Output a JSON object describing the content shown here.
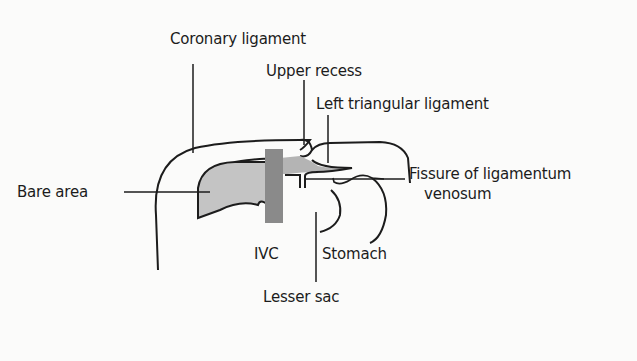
{
  "diagram": {
    "type": "anatomical-cross-section",
    "colors": {
      "background": "#fbfbfa",
      "stroke": "#1c1c1c",
      "bare_area_fill": "#c4c4c4",
      "ivc_fill": "#8a8a8a",
      "recess_fill": "#b4b4b4"
    },
    "labels": {
      "coronary_ligament": "Coronary ligament",
      "upper_recess": "Upper recess",
      "left_triangular_ligament": "Left triangular ligament",
      "bare_area": "Bare area",
      "fissure_line1": "Fissure of ligamentum",
      "fissure_line2": "venosum",
      "ivc": "IVC",
      "stomach": "Stomach",
      "lesser_sac": "Lesser sac"
    }
  }
}
